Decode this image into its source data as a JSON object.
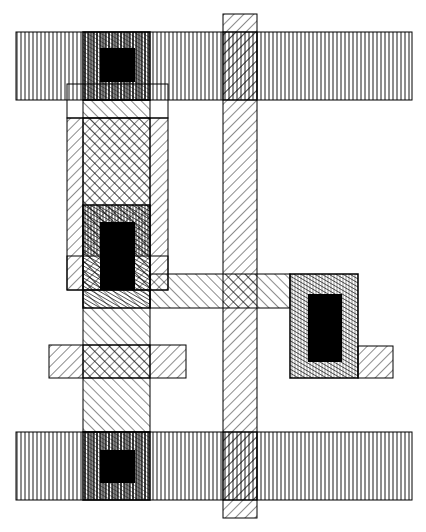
{
  "diagram": {
    "type": "vlsi-layout",
    "canvas": {
      "width": 426,
      "height": 532,
      "background": "#ffffff",
      "ink": "#000000"
    },
    "layers": [
      {
        "name": "metal",
        "pattern": "vertical-lines"
      },
      {
        "name": "polysilicon",
        "pattern": "diagonal-lines-down"
      },
      {
        "name": "diffusion",
        "pattern": "diagonal-lines-up"
      },
      {
        "name": "contact-cut",
        "pattern": "solid-black"
      },
      {
        "name": "implant-outline",
        "pattern": "outline"
      }
    ],
    "shapes": {
      "metal_top": {
        "x": 16,
        "y": 32,
        "w": 396,
        "h": 68
      },
      "metal_bottom": {
        "x": 16,
        "y": 432,
        "w": 396,
        "h": 68
      },
      "metal_right_contact": {
        "x": 290,
        "y": 274,
        "w": 68,
        "h": 104
      },
      "poly_vertical": {
        "x": 223,
        "y": 14,
        "w": 34,
        "h": 504
      },
      "poly_left_bar": {
        "x": 49,
        "y": 345,
        "w": 137,
        "h": 33
      },
      "poly_right_ext": {
        "x": 358,
        "y": 346,
        "w": 35,
        "h": 32
      },
      "poly_left_column": {
        "x": 67,
        "y": 118,
        "w": 101,
        "h": 172
      },
      "diff_vertical": {
        "x": 83,
        "y": 100,
        "w": 67,
        "h": 332
      },
      "diff_horizontal": {
        "x": 150,
        "y": 274,
        "w": 140,
        "h": 34
      },
      "outline_top": {
        "x": 67,
        "y": 84,
        "w": 101,
        "h": 34
      },
      "outline_mid": {
        "x": 67,
        "y": 256,
        "w": 101,
        "h": 34
      },
      "contact_top_box": {
        "x": 83,
        "y": 32,
        "w": 67,
        "h": 68
      },
      "contact_top_cut": {
        "x": 100,
        "y": 48,
        "w": 35,
        "h": 34
      },
      "contact_mid_box": {
        "x": 83,
        "y": 205,
        "w": 67,
        "h": 103
      },
      "contact_mid_cut": {
        "x": 100,
        "y": 222,
        "w": 35,
        "h": 68
      },
      "contact_right_cut": {
        "x": 308,
        "y": 294,
        "w": 34,
        "h": 68
      },
      "contact_bottom_box": {
        "x": 83,
        "y": 432,
        "w": 67,
        "h": 68
      },
      "contact_bottom_cut": {
        "x": 100,
        "y": 450,
        "w": 35,
        "h": 33
      }
    }
  }
}
